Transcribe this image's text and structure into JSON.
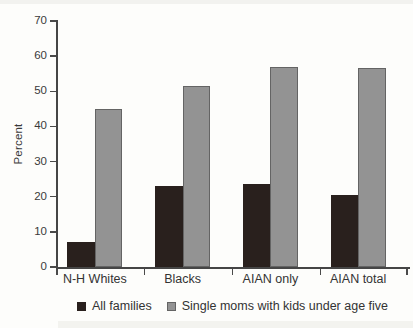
{
  "figure": {
    "background": "#fdfdfb"
  },
  "colors": {
    "axis": "#454545",
    "text": "#3a3a3a",
    "all_families_bar": "#29201d",
    "single_moms_bar": "#939393",
    "single_moms_border": "#646464"
  },
  "chart_data": {
    "type": "bar",
    "title": "",
    "xlabel": "",
    "ylabel": "Percent",
    "ylim": [
      0,
      70
    ],
    "yticks": [
      0,
      10,
      20,
      30,
      40,
      50,
      60,
      70
    ],
    "grid": false,
    "legend_position": "bottom",
    "categories": [
      "N-H Whites",
      "Blacks",
      "AIAN only",
      "AIAN total"
    ],
    "series": [
      {
        "name": "All families",
        "color": "#29201d",
        "values": [
          7,
          23,
          23.5,
          20.5
        ]
      },
      {
        "name": "Single moms with kids under age five",
        "color": "#939393",
        "border": "#646464",
        "values": [
          45,
          51.5,
          57,
          56.5
        ]
      }
    ]
  }
}
